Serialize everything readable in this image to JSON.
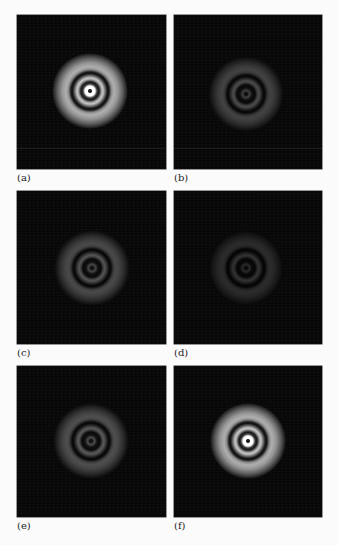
{
  "figure": {
    "panels": [
      {
        "id": "a",
        "label": "(a)",
        "brightness": 1.0,
        "x": 17,
        "y": 15,
        "w": 149,
        "h": 154,
        "cx": 73,
        "cy": 76,
        "label_y": 173,
        "hline": 133
      },
      {
        "id": "b",
        "label": "(b)",
        "brightness": 0.38,
        "x": 174,
        "y": 15,
        "w": 148,
        "h": 154,
        "cx": 72,
        "cy": 79,
        "label_y": 173,
        "hline": 133
      },
      {
        "id": "c",
        "label": "(c)",
        "brightness": 0.42,
        "x": 17,
        "y": 191,
        "w": 149,
        "h": 153,
        "cx": 75,
        "cy": 77,
        "label_y": 348,
        "hline": null
      },
      {
        "id": "d",
        "label": "(d)",
        "brightness": 0.25,
        "x": 174,
        "y": 191,
        "w": 148,
        "h": 153,
        "cx": 72,
        "cy": 77,
        "label_y": 348,
        "hline": null
      },
      {
        "id": "e",
        "label": "(e)",
        "brightness": 0.45,
        "x": 17,
        "y": 366,
        "w": 149,
        "h": 151,
        "cx": 74,
        "cy": 75,
        "label_y": 521,
        "hline": null
      },
      {
        "id": "f",
        "label": "(f)",
        "brightness": 1.0,
        "x": 174,
        "y": 366,
        "w": 148,
        "h": 151,
        "cx": 74,
        "cy": 75,
        "label_y": 521,
        "hline": null
      }
    ]
  }
}
